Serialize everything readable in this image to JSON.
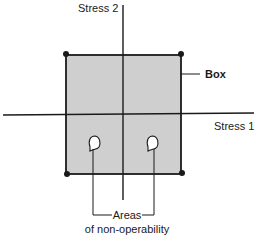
{
  "diagram": {
    "axes": {
      "y_label": "Stress 2",
      "x_label": "Stress 1"
    },
    "box_label": "Box",
    "callout": {
      "line1": "Areas",
      "line2": "of non-operability"
    },
    "colors": {
      "box_fill": "#cfcfcf",
      "lines": "#1a1a1a",
      "background": "#ffffff"
    }
  }
}
